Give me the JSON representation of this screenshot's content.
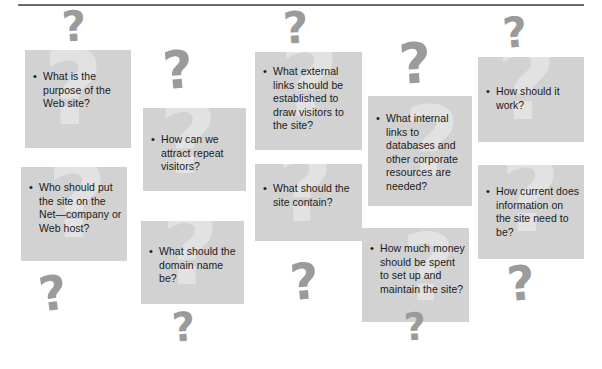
{
  "figure": {
    "box_color": "#d2d2d2",
    "watermark_color": "#e2e2e2",
    "decoration_color": "#9b9b9b",
    "text_color": "#1a1a1a",
    "bullet_glyph": "•",
    "question_glyph": "?"
  },
  "boxes": [
    {
      "id": "purpose",
      "text": "What is the purpose of the Web site?",
      "x": 25,
      "y": 50,
      "w": 106,
      "h": 98,
      "text_x": 8,
      "text_y": 20,
      "text_w": 92,
      "wm_x": 18,
      "wm_y": -6,
      "wm_size": 104
    },
    {
      "id": "host",
      "text": "Who should put the site on the Net—company or Web host?",
      "x": 21,
      "y": 167,
      "w": 106,
      "h": 94,
      "text_x": 8,
      "text_y": 14,
      "text_w": 94,
      "wm_x": 26,
      "wm_y": -10,
      "wm_size": 104
    },
    {
      "id": "repeat-visitors",
      "text": "How can we attract repeat visitors?",
      "x": 143,
      "y": 108,
      "w": 103,
      "h": 83,
      "text_x": 8,
      "text_y": 25,
      "text_w": 90,
      "wm_x": 16,
      "wm_y": -12,
      "wm_size": 100
    },
    {
      "id": "domain-name",
      "text": "What should the domain name be?",
      "x": 141,
      "y": 221,
      "w": 103,
      "h": 83,
      "text_x": 8,
      "text_y": 24,
      "text_w": 90,
      "wm_x": 20,
      "wm_y": -14,
      "wm_size": 100
    },
    {
      "id": "external-links",
      "text": "What external links should be established to draw visitors to the site?",
      "x": 255,
      "y": 52,
      "w": 107,
      "h": 98,
      "text_x": 8,
      "text_y": 13,
      "text_w": 95,
      "wm_x": 24,
      "wm_y": -16,
      "wm_size": 104
    },
    {
      "id": "site-contain",
      "text": "What should the site contain?",
      "x": 255,
      "y": 164,
      "w": 107,
      "h": 77,
      "text_x": 8,
      "text_y": 18,
      "text_w": 90,
      "wm_x": 22,
      "wm_y": -16,
      "wm_size": 96
    },
    {
      "id": "internal-links",
      "text": "What internal links to databases and other corporate resources are needed?",
      "x": 368,
      "y": 96,
      "w": 104,
      "h": 110,
      "text_x": 8,
      "text_y": 16,
      "text_w": 92,
      "wm_x": 36,
      "wm_y": 6,
      "wm_size": 96
    },
    {
      "id": "budget",
      "text": "How much money should be spent to set up and maintain the site?",
      "x": 362,
      "y": 228,
      "w": 107,
      "h": 94,
      "text_x": 8,
      "text_y": 14,
      "text_w": 95,
      "wm_x": 40,
      "wm_y": 2,
      "wm_size": 92
    },
    {
      "id": "how-work",
      "text": "How should it work?",
      "x": 478,
      "y": 57,
      "w": 106,
      "h": 85,
      "text_x": 8,
      "text_y": 28,
      "text_w": 92,
      "wm_x": 18,
      "wm_y": -18,
      "wm_size": 104
    },
    {
      "id": "currency",
      "text": "How current does information on the site need to be?",
      "x": 478,
      "y": 165,
      "w": 106,
      "h": 94,
      "text_x": 8,
      "text_y": 20,
      "text_w": 94,
      "wm_x": 22,
      "wm_y": -14,
      "wm_size": 104
    }
  ],
  "decorations": [
    {
      "id": "deco-top-left",
      "x": 62,
      "y": 10,
      "size": 42,
      "rotate": -4
    },
    {
      "id": "deco-col2-top",
      "x": 163,
      "y": 50,
      "size": 52,
      "rotate": -5
    },
    {
      "id": "deco-col3-top",
      "x": 283,
      "y": 10,
      "size": 44,
      "rotate": -3
    },
    {
      "id": "deco-col4-top",
      "x": 399,
      "y": 42,
      "size": 56,
      "rotate": -4
    },
    {
      "id": "deco-col5-top",
      "x": 503,
      "y": 16,
      "size": 42,
      "rotate": -6
    },
    {
      "id": "deco-left-lower",
      "x": 39,
      "y": 274,
      "size": 48,
      "rotate": -8
    },
    {
      "id": "deco-col2-bottom",
      "x": 172,
      "y": 311,
      "size": 40,
      "rotate": -4
    },
    {
      "id": "deco-col3-bottom",
      "x": 290,
      "y": 262,
      "size": 50,
      "rotate": -5
    },
    {
      "id": "deco-col4-bottom",
      "x": 404,
      "y": 312,
      "size": 38,
      "rotate": -4
    },
    {
      "id": "deco-col5-bottom",
      "x": 507,
      "y": 264,
      "size": 48,
      "rotate": -5
    }
  ]
}
